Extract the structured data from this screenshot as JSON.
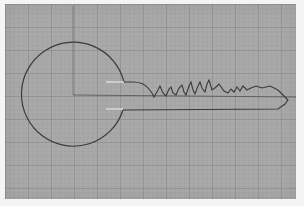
{
  "image": {
    "subject": "Pencil drawing of a key on graph paper",
    "description": "Outline of a key with a circular bow and a toothed blade drawn on grey grid paper",
    "colors": {
      "paper": "#a9a9a9",
      "grid": "#8c8c8c",
      "ink": "#3a3a3a",
      "highlight": "#e6e6e6",
      "background": "#f4f4f4"
    },
    "elements": [
      {
        "name": "key-bow",
        "shape": "circle",
        "center": [
          70,
          110
        ],
        "radius": 52
      },
      {
        "name": "key-blade",
        "shape": "toothed bar",
        "from_x": 120,
        "to_x": 288
      },
      {
        "name": "center-line-vertical",
        "x": 73
      },
      {
        "name": "center-line-horizontal",
        "y": 96
      }
    ]
  }
}
